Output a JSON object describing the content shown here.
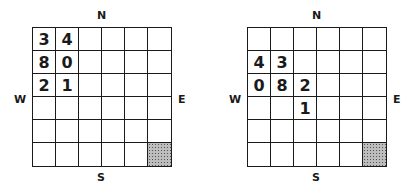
{
  "panels": [
    {
      "id": "left",
      "compass": {
        "n": "N",
        "s": "S",
        "w": "W",
        "e": "E"
      },
      "rows": 6,
      "cols": 6,
      "cells": [
        [
          "3",
          "4",
          "",
          "",
          "",
          ""
        ],
        [
          "8",
          "0",
          "",
          "",
          "",
          ""
        ],
        [
          "2",
          "1",
          "",
          "",
          "",
          ""
        ],
        [
          "",
          "",
          "",
          "",
          "",
          ""
        ],
        [
          "",
          "",
          "",
          "",
          "",
          ""
        ],
        [
          "",
          "",
          "",
          "",
          "",
          ""
        ]
      ],
      "shaded": [
        [
          5,
          5
        ]
      ]
    },
    {
      "id": "right",
      "compass": {
        "n": "N",
        "s": "S",
        "w": "W",
        "e": "E"
      },
      "rows": 6,
      "cols": 6,
      "cells": [
        [
          "",
          "",
          "",
          "",
          "",
          ""
        ],
        [
          "4",
          "3",
          "",
          "",
          "",
          ""
        ],
        [
          "0",
          "8",
          "2",
          "",
          "",
          ""
        ],
        [
          "",
          "",
          "1",
          "",
          "",
          ""
        ],
        [
          "",
          "",
          "",
          "",
          "",
          ""
        ],
        [
          "",
          "",
          "",
          "",
          "",
          ""
        ]
      ],
      "shaded": [
        [
          5,
          5
        ]
      ]
    }
  ]
}
